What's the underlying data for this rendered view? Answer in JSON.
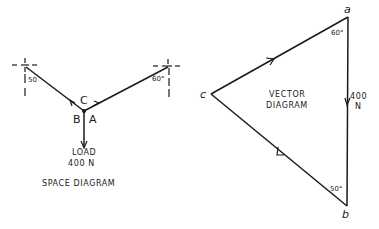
{
  "space_diagram": {
    "title": "SPACE DIAGRAM",
    "load_label": "LOAD",
    "load_value": "400 N",
    "left_angle": "50",
    "right_angle": "60°",
    "label_c": "C",
    "label_b": "B",
    "label_a": "A"
  },
  "vector_diagram": {
    "title_line1": "VECTOR",
    "title_line2": "DIAGRAM",
    "vertex_a": "a",
    "vertex_b": "b",
    "vertex_c": "c",
    "angle_a": "60°",
    "angle_b": "50°",
    "force_value_line1": "400",
    "force_value_line2": "N"
  },
  "colors": {
    "ink": "#1a1a1a",
    "background": "#ffffff"
  }
}
